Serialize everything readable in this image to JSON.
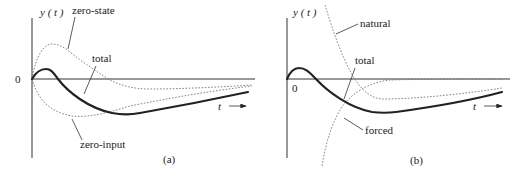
{
  "panels": [
    {
      "id": "a",
      "caption": "(a)",
      "y_axis_label": "y ( t )",
      "x_axis_label": "t",
      "origin_label": "0",
      "curves": [
        {
          "name": "total",
          "label": "total",
          "style": "solid-thick"
        },
        {
          "name": "zero-state",
          "label": "zero-state",
          "style": "dotted"
        },
        {
          "name": "zero-input",
          "label": "zero-input",
          "style": "dotted"
        }
      ]
    },
    {
      "id": "b",
      "caption": "(b)",
      "y_axis_label": "y ( t )",
      "x_axis_label": "t",
      "origin_label": "0",
      "curves": [
        {
          "name": "total",
          "label": "total",
          "style": "solid-thick"
        },
        {
          "name": "natural",
          "label": "natural",
          "style": "dotted"
        },
        {
          "name": "forced",
          "label": "forced",
          "style": "dotted"
        }
      ]
    }
  ],
  "colors": {
    "curve": "#222222",
    "dotted": "#777777",
    "axis": "#333333"
  }
}
